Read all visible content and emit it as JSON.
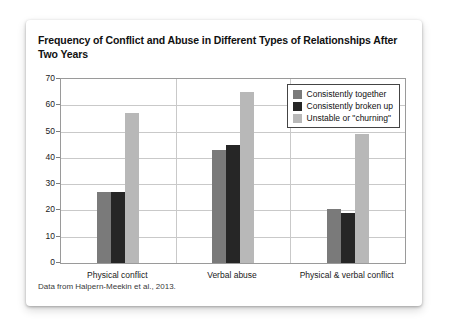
{
  "card": {
    "title": "Frequency of Conflict and Abuse in Different Types of Relationships After Two Years",
    "source_note": "Data from Halpern-Meekin et al., 2013."
  },
  "chart_data": {
    "type": "bar",
    "title": "Frequency of Conflict and Abuse in Different Types of Relationships After Two Years",
    "xlabel": "",
    "ylabel": "",
    "ylim": [
      0,
      70
    ],
    "yticks": [
      0,
      10,
      20,
      30,
      40,
      50,
      60,
      70
    ],
    "grid": true,
    "legend_position": "top-right",
    "categories": [
      "Physical conflict",
      "Verbal abuse",
      "Physical & verbal conflict"
    ],
    "series": [
      {
        "name": "Consistently together",
        "color": "#7a7a7a",
        "values": [
          27,
          43,
          20.5
        ]
      },
      {
        "name": "Consistently broken up",
        "color": "#262626",
        "values": [
          27,
          45,
          19
        ]
      },
      {
        "name": "Unstable or \"churning\"",
        "color": "#b8b8b8",
        "values": [
          57,
          65,
          49
        ]
      }
    ],
    "annotations": [
      "Data from Halpern-Meekin et al., 2013."
    ]
  }
}
